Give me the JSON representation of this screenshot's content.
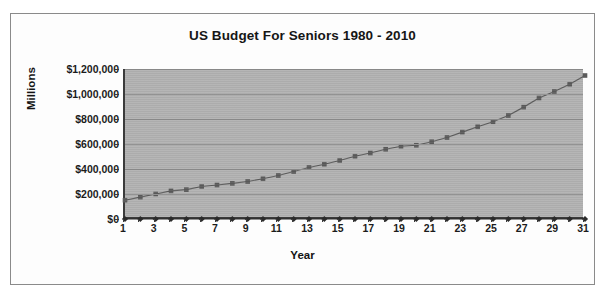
{
  "chart_data": {
    "type": "line",
    "title": "US Budget For Seniors 1980 - 2010",
    "xlabel": "Year",
    "ylabel": "Millions",
    "grid": true,
    "legend": "none",
    "xlim": [
      1,
      31
    ],
    "ylim": [
      0,
      1200000
    ],
    "ytick_labels": [
      "$1,200,000",
      "$1,000,000",
      "$800,000",
      "$600,000",
      "$400,000",
      "$200,000",
      "$0"
    ],
    "ytick_values": [
      1200000,
      1000000,
      800000,
      600000,
      400000,
      200000,
      0
    ],
    "xtick_labels": [
      "1",
      "3",
      "5",
      "7",
      "9",
      "11",
      "13",
      "15",
      "17",
      "19",
      "21",
      "23",
      "25",
      "27",
      "29",
      "31"
    ],
    "xtick_values": [
      1,
      3,
      5,
      7,
      9,
      11,
      13,
      15,
      17,
      19,
      21,
      23,
      25,
      27,
      29,
      31
    ],
    "x": [
      1,
      2,
      3,
      4,
      5,
      6,
      7,
      8,
      9,
      10,
      11,
      12,
      13,
      14,
      15,
      16,
      17,
      18,
      19,
      20,
      21,
      22,
      23,
      24,
      25,
      26,
      27,
      28,
      29,
      30,
      31
    ],
    "series": [
      {
        "name": "Budget",
        "marker": "square",
        "color": "#5b5b5b",
        "values": [
          150000,
          175000,
          200000,
          225000,
          235000,
          260000,
          272000,
          285000,
          300000,
          322000,
          348000,
          380000,
          412000,
          438000,
          468000,
          502000,
          528000,
          558000,
          582000,
          590000,
          618000,
          652000,
          695000,
          738000,
          778000,
          828000,
          895000,
          968000,
          1020000,
          1078000,
          1148000
        ]
      },
      {
        "name": "Baseline",
        "marker": "diamond",
        "color": "#2b2b2b",
        "values": [
          0,
          0,
          0,
          0,
          0,
          0,
          0,
          0,
          0,
          0,
          0,
          0,
          0,
          0,
          0,
          0,
          0,
          0,
          0,
          0,
          0,
          0,
          0,
          0,
          0,
          0,
          0,
          0,
          0,
          0,
          0
        ]
      }
    ]
  },
  "colors": {
    "plot_background": "#b2b2b2",
    "gridline": "#8d8d8d",
    "axis": "#3b3b3b",
    "series_budget": "#5b5b5b",
    "series_baseline": "#2b2b2b",
    "border": "#8a8a8a",
    "text": "#1a1a1a"
  }
}
